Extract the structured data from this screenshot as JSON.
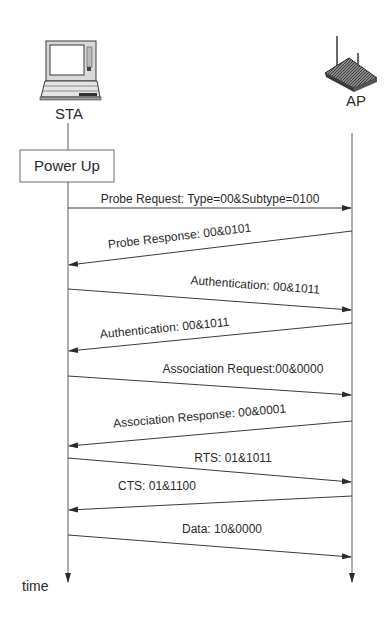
{
  "diagram": {
    "type": "sequence-diagram",
    "colors": {
      "line": "#3a3a3a",
      "text": "#2a2a2a",
      "box_border": "#6a6a6a",
      "background": "#ffffff"
    },
    "participants": [
      {
        "id": "sta",
        "label": "STA",
        "icon": "laptop-icon",
        "x": 68
      },
      {
        "id": "ap",
        "label": "AP",
        "icon": "wireless-router-icon",
        "x": 352
      }
    ],
    "state_box": {
      "label": "Power Up",
      "participant": "sta"
    },
    "messages": [
      {
        "label": "Probe Request: Type=00&Subtype=0100",
        "from": "sta",
        "to": "ap",
        "y1": 208,
        "y2": 208,
        "lx": 210,
        "ly": 203,
        "angle": 0
      },
      {
        "label": "Probe Response: 00&0101",
        "from": "ap",
        "to": "sta",
        "y1": 231,
        "y2": 265,
        "lx": 180,
        "ly": 240,
        "angle": -6.8
      },
      {
        "label": "Authentication: 00&1011",
        "from": "sta",
        "to": "ap",
        "y1": 289,
        "y2": 310,
        "lx": 255,
        "ly": 289,
        "angle": 4.2
      },
      {
        "label": "Authentication: 00&1011",
        "from": "ap",
        "to": "sta",
        "y1": 323,
        "y2": 351,
        "lx": 165,
        "ly": 332,
        "angle": -5.6
      },
      {
        "label": "Association Request:00&0000",
        "from": "sta",
        "to": "ap",
        "y1": 376,
        "y2": 395,
        "lx": 243,
        "ly": 373,
        "angle": 0
      },
      {
        "label": "Association Response: 00&0001",
        "from": "ap",
        "to": "sta",
        "y1": 421,
        "y2": 446,
        "lx": 200,
        "ly": 420,
        "angle": -5.0
      },
      {
        "label": "RTS: 01&1011",
        "from": "sta",
        "to": "ap",
        "y1": 458,
        "y2": 482,
        "lx": 233,
        "ly": 462,
        "angle": 0
      },
      {
        "label": "CTS: 01&1100",
        "from": "ap",
        "to": "sta",
        "y1": 496,
        "y2": 510,
        "lx": 157,
        "ly": 490,
        "angle": 0
      },
      {
        "label": "Data: 10&0000",
        "from": "sta",
        "to": "ap",
        "y1": 535,
        "y2": 557,
        "lx": 222,
        "ly": 533,
        "angle": 0
      }
    ],
    "time_axis_label": "time"
  }
}
